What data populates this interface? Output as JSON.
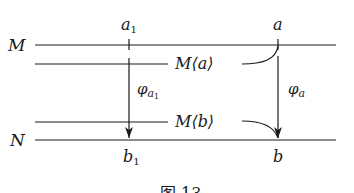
{
  "diagram": {
    "type": "mapping-diagram",
    "lines": {
      "top": {
        "label": "M"
      },
      "bottom": {
        "label": "N"
      }
    },
    "points": {
      "a1": {
        "base": "a",
        "sub": "1"
      },
      "a": {
        "base": "a"
      },
      "b1": {
        "base": "b",
        "sub": "1"
      },
      "b": {
        "base": "b"
      }
    },
    "arrows": {
      "phi_a1": {
        "base": "φ",
        "sub": "a",
        "subsub": "1"
      },
      "phi_a": {
        "base": "φ",
        "sub": "a"
      }
    },
    "sets": {
      "Ma": {
        "text": "M⟨a⟩"
      },
      "Mb": {
        "text": "M⟨b⟩"
      }
    },
    "caption": "图 13",
    "colors": {
      "ink": "#1a1a1a",
      "background": "#ffffff"
    }
  }
}
